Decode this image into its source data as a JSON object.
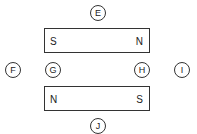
{
  "diagram": {
    "title": "",
    "magnets": [
      {
        "id": "top-magnet",
        "left_pole": "S",
        "right_pole": "N"
      },
      {
        "id": "bottom-magnet",
        "left_pole": "N",
        "right_pole": "S"
      }
    ],
    "points": [
      {
        "label": "E",
        "x": 98,
        "y": 13
      },
      {
        "label": "F",
        "x": 13,
        "y": 70
      },
      {
        "label": "G",
        "x": 53,
        "y": 70
      },
      {
        "label": "H",
        "x": 142,
        "y": 70
      },
      {
        "label": "I",
        "x": 182,
        "y": 70
      },
      {
        "label": "J",
        "x": 98,
        "y": 126
      }
    ]
  }
}
